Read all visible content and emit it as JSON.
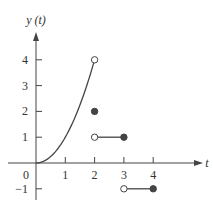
{
  "chart_data": {
    "type": "line",
    "title": "",
    "xlabel": "t",
    "ylabel": "y(t)",
    "xlim": [
      -0.6,
      5.2
    ],
    "ylim": [
      -1.4,
      4.9
    ],
    "grid": false,
    "legend": null,
    "x_ticks": [
      0,
      1,
      2,
      3,
      4
    ],
    "x_tick_labels": [
      "0",
      "1",
      "2",
      "3",
      "4"
    ],
    "y_ticks": [
      -1,
      1,
      2,
      3,
      4
    ],
    "y_tick_labels": [
      "−1",
      "1",
      "2",
      "3",
      "4"
    ],
    "pieces": [
      {
        "name": "parabola",
        "formula": "y = t^2",
        "domain": [
          0,
          2
        ],
        "start": {
          "x": 0,
          "y": 0,
          "marker": "none"
        },
        "end": {
          "x": 2,
          "y": 4,
          "marker": "open"
        }
      },
      {
        "name": "isolated point",
        "x": 2,
        "y": 2,
        "marker": "filled"
      },
      {
        "name": "segment 1",
        "domain": [
          2,
          3
        ],
        "y": 1,
        "start": {
          "x": 2,
          "y": 1,
          "marker": "open"
        },
        "end": {
          "x": 3,
          "y": 1,
          "marker": "filled"
        }
      },
      {
        "name": "segment 2",
        "domain": [
          3,
          4
        ],
        "y": -1,
        "start": {
          "x": 3,
          "y": -1,
          "marker": "open"
        },
        "end": {
          "x": 4,
          "y": -1,
          "marker": "filled"
        }
      }
    ],
    "colors": {
      "stroke": "#444444",
      "marker_fill": "#444444",
      "text": "#333333"
    }
  },
  "labels": {
    "y_axis": "y (t)",
    "x_axis": "t",
    "origin": "0"
  }
}
